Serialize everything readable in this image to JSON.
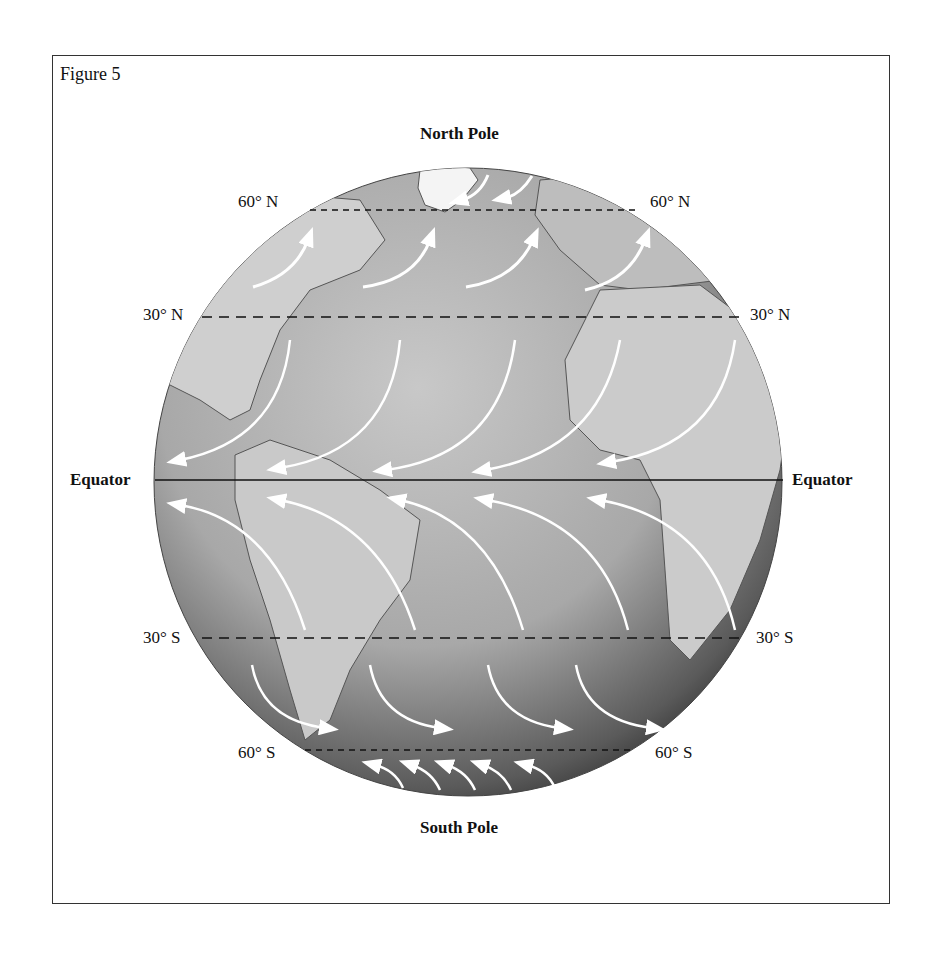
{
  "figure": {
    "title": "Figure 5",
    "top_label": "North Pole",
    "bottom_label": "South Pole"
  },
  "latitudes": {
    "n60_left": "60° N",
    "n60_right": "60° N",
    "n30_left": "30° N",
    "n30_right": "30° N",
    "equator_left": "Equator",
    "equator_right": "Equator",
    "s30_left": "30° S",
    "s30_right": "30° S",
    "s60_left": "60° S",
    "s60_right": "60° S"
  },
  "wind_bands": [
    {
      "name": "Polar easterlies (north)",
      "between": "60°N–pole",
      "direction": "toward southwest"
    },
    {
      "name": "Westerlies (north)",
      "between": "30°N–60°N",
      "direction": "toward northeast"
    },
    {
      "name": "Northeast trade winds",
      "between": "0°–30°N",
      "direction": "toward southwest"
    },
    {
      "name": "Southeast trade winds",
      "between": "0°–30°S",
      "direction": "toward northwest"
    },
    {
      "name": "Westerlies (south)",
      "between": "30°S–60°S",
      "direction": "toward southeast"
    },
    {
      "name": "Polar easterlies (south)",
      "between": "60°S–pole",
      "direction": "toward northwest"
    }
  ],
  "colors": {
    "ocean_light": "#b9b9b9",
    "ocean_dark": "#2a2a2a",
    "land": "#d4d4d4",
    "arrow": "#ffffff",
    "line": "#111111"
  }
}
